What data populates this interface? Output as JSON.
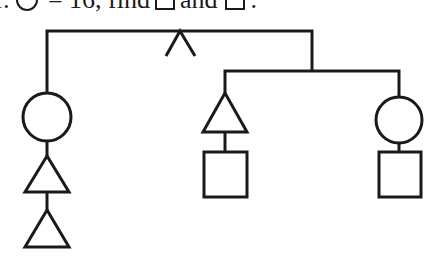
{
  "question": {
    "prefix": "f:",
    "equals_text": "= 16, find",
    "and_text": "and",
    "suffix": "."
  },
  "diagram": {
    "stroke_color": "#1a1a1a",
    "stroke_width": 3,
    "root_bar": {
      "x1": 47,
      "x2": 312,
      "y": 31
    },
    "root_caret": {
      "apex": [
        180,
        31
      ],
      "left": [
        166,
        56
      ],
      "right": [
        195,
        56
      ]
    },
    "left_branch": {
      "x": 47,
      "circle": {
        "cx": 47,
        "cy": 117,
        "r": 24
      },
      "triangles": [
        {
          "apex": [
            47,
            156
          ],
          "base_y": 192,
          "half_width": 22
        },
        {
          "apex": [
            47,
            210
          ],
          "base_y": 247,
          "half_width": 22
        }
      ]
    },
    "right_subtree": {
      "drop": {
        "x": 312,
        "y1": 31,
        "y2": 71
      },
      "bar": {
        "x1": 225,
        "x2": 399,
        "y": 71
      },
      "middle_child": {
        "triangle": {
          "apex": [
            225,
            93
          ],
          "base_y": 132,
          "half_width": 22
        },
        "square": {
          "x": 204,
          "y": 152,
          "w": 43,
          "h": 45
        }
      },
      "right_child": {
        "circle": {
          "cx": 399,
          "cy": 120,
          "r": 23
        },
        "square": {
          "x": 379,
          "y": 152,
          "w": 42,
          "h": 45
        }
      }
    }
  }
}
